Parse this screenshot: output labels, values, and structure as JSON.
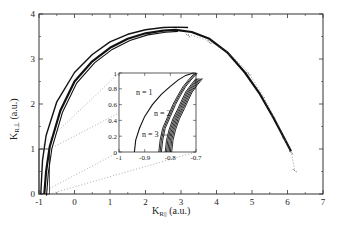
{
  "chart_data": {
    "type": "line",
    "title": "",
    "xlabel": "K_R|| (a.u.)",
    "ylabel": "K_R⊥ (a.u.)",
    "xlabel_main": "K",
    "xlabel_sub": "R||",
    "xlabel_unit": " (a.u.)",
    "ylabel_main": "K",
    "ylabel_sub": "R⊥",
    "ylabel_unit": " (a.u.)",
    "xlim": [
      -1,
      7
    ],
    "ylim": [
      0,
      4
    ],
    "xticks": [
      "-1",
      "0",
      "1",
      "2",
      "3",
      "4",
      "5",
      "6",
      "7"
    ],
    "yticks": [
      "0",
      "1",
      "2",
      "3",
      "4"
    ],
    "grid": false,
    "legend": "none",
    "series": [
      {
        "name": "n = 1",
        "style": "solid",
        "x": [
          -0.95,
          -0.9,
          -0.8,
          -0.5,
          0,
          0.5,
          1,
          1.5,
          2,
          2.5,
          2.85,
          3.2
        ],
        "y": [
          0,
          0.75,
          1.3,
          2.05,
          2.7,
          3.1,
          3.38,
          3.55,
          3.65,
          3.7,
          3.71,
          3.7
        ]
      },
      {
        "name": "n = 2",
        "style": "solid-thick",
        "x": [
          -0.85,
          -0.8,
          -0.7,
          -0.4,
          0,
          0.5,
          1,
          1.5,
          2,
          2.5,
          2.85,
          3.3,
          3.8,
          4.3,
          4.8,
          5.2,
          5.6,
          5.9,
          6.1
        ],
        "y": [
          0,
          0.5,
          1.05,
          1.85,
          2.5,
          2.95,
          3.25,
          3.45,
          3.57,
          3.63,
          3.65,
          3.6,
          3.45,
          3.15,
          2.7,
          2.25,
          1.7,
          1.25,
          0.95
        ]
      },
      {
        "name": "n = 3+",
        "style": "dotted-scatter",
        "x": [
          3.2,
          3.8,
          4.4,
          4.9,
          5.3,
          5.6,
          5.9,
          6.1,
          6.2
        ],
        "y": [
          3.55,
          3.4,
          3.1,
          2.7,
          2.2,
          1.75,
          1.25,
          0.95,
          0.55
        ]
      }
    ],
    "zoom_box": {
      "x": [
        -1,
        -0.7
      ],
      "y": [
        0,
        1
      ]
    },
    "inset": {
      "xlim": [
        -1,
        -0.7
      ],
      "ylim": [
        0,
        1
      ],
      "xticks": [
        "-1",
        "-0.9",
        "-0.8",
        "-0.7"
      ],
      "yticks": [
        "0",
        "0.2",
        "0.4",
        "0.6",
        "0.8",
        "1"
      ],
      "annotations": [
        "n = 1",
        "n = 2",
        "n = 3"
      ],
      "curves": [
        {
          "name": "n = 1",
          "x": [
            -0.94,
            -0.935,
            -0.92,
            -0.9,
            -0.87,
            -0.835,
            -0.8,
            -0.77,
            -0.74,
            -0.71
          ],
          "y": [
            0,
            0.15,
            0.3,
            0.45,
            0.6,
            0.73,
            0.83,
            0.91,
            0.97,
            1.0
          ]
        },
        {
          "name": "n = 2",
          "x": [
            -0.845,
            -0.84,
            -0.83,
            -0.81,
            -0.79,
            -0.77,
            -0.75,
            -0.73,
            -0.705
          ],
          "y": [
            0,
            0.15,
            0.3,
            0.45,
            0.6,
            0.72,
            0.83,
            0.91,
            1.0
          ]
        },
        {
          "name": "n = 3",
          "x": [
            -0.82,
            -0.815,
            -0.805,
            -0.79,
            -0.77,
            -0.755,
            -0.74,
            -0.72,
            -0.7
          ],
          "y": [
            0,
            0.15,
            0.28,
            0.42,
            0.55,
            0.66,
            0.76,
            0.85,
            0.93
          ]
        }
      ]
    }
  }
}
